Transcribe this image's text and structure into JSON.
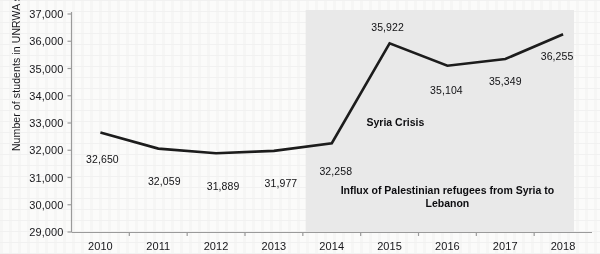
{
  "chart_data": {
    "type": "line",
    "title": "",
    "xlabel": "",
    "ylabel": "Number of students in UNRWA schools",
    "categories": [
      "2010",
      "2011",
      "2012",
      "2013",
      "2014",
      "2015",
      "2016",
      "2017",
      "2018"
    ],
    "values": [
      32650,
      32059,
      31889,
      31977,
      32258,
      35922,
      35104,
      35349,
      36255
    ],
    "value_labels": [
      "32,650",
      "32,059",
      "31,889",
      "31,977",
      "32,258",
      "35,922",
      "35,104",
      "35,349",
      "36,255"
    ],
    "ylim": [
      29000,
      37000
    ],
    "ytick_labels": [
      "29,000",
      "30,000",
      "31,000",
      "32,000",
      "33,000",
      "34,000",
      "35,000",
      "36,000",
      "37,000"
    ],
    "ytick_values": [
      29000,
      30000,
      31000,
      32000,
      33000,
      34000,
      35000,
      36000,
      37000
    ],
    "grid": false,
    "legend": "none",
    "series": [
      {
        "name": "Number of students in UNRWA schools",
        "values": [
          32650,
          32059,
          31889,
          31977,
          32258,
          35922,
          35104,
          35349,
          36255
        ],
        "color": "#1c1c1c"
      }
    ],
    "annotations": [
      {
        "text": "Syria Crisis",
        "x": 2015.1,
        "y": 33000
      },
      {
        "text": "Influx of Palestinian refugees from Syria to Lebanon",
        "x": 2016.0,
        "y": 30300
      }
    ],
    "shaded_region": {
      "label": "Syria Crisis period",
      "x_start": 2013.55,
      "x_end": 2018.5,
      "color": "#e9e9e9"
    }
  },
  "colors": {
    "line": "#1c1c1c",
    "axis": "#9a9a9a",
    "text": "#16161a",
    "shade": "#e9e9e9",
    "page": "#fbfbfa"
  }
}
